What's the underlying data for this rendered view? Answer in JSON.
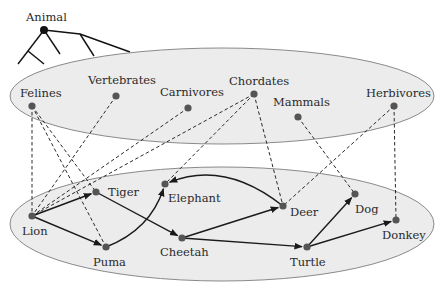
{
  "colors": {
    "ellipse_fill": "#ececec",
    "ellipse_stroke": "#8a8a8a",
    "node": "#555555",
    "root_node": "#111111",
    "edge": "#1a1a1a",
    "dashed": "#2a2a2a"
  },
  "tree": {
    "root_label": "Animal",
    "root": [
      44,
      30
    ]
  },
  "upper_layer": {
    "name": "categories",
    "ellipse": {
      "cx": 222,
      "cy": 96,
      "rx": 212,
      "ry": 48
    },
    "nodes": [
      {
        "id": "felines",
        "label": "Felines",
        "x": 32,
        "y": 106,
        "lx": 20,
        "ly": 97
      },
      {
        "id": "vertebrates",
        "label": "Vertebrates",
        "x": 116,
        "y": 96,
        "lx": 88,
        "ly": 84
      },
      {
        "id": "carnivores",
        "label": "Carnivores",
        "x": 188,
        "y": 108,
        "lx": 160,
        "ly": 96
      },
      {
        "id": "chordates",
        "label": "Chordates",
        "x": 254,
        "y": 94,
        "lx": 229,
        "ly": 85
      },
      {
        "id": "mammals",
        "label": "Mammals",
        "x": 298,
        "y": 117,
        "lx": 273,
        "ly": 106
      },
      {
        "id": "herbivores",
        "label": "Herbivores",
        "x": 394,
        "y": 106,
        "lx": 366,
        "ly": 97
      }
    ]
  },
  "lower_layer": {
    "name": "instances",
    "ellipse": {
      "cx": 222,
      "cy": 224,
      "rx": 212,
      "ry": 57
    },
    "nodes": [
      {
        "id": "lion",
        "label": "Lion",
        "x": 32,
        "y": 216,
        "lx": 22,
        "ly": 235
      },
      {
        "id": "tiger",
        "label": "Tiger",
        "x": 96,
        "y": 192,
        "lx": 108,
        "ly": 196
      },
      {
        "id": "puma",
        "label": "Puma",
        "x": 106,
        "y": 247,
        "lx": 93,
        "ly": 266
      },
      {
        "id": "elephant",
        "label": "Elephant",
        "x": 165,
        "y": 184,
        "lx": 168,
        "ly": 202
      },
      {
        "id": "cheetah",
        "label": "Cheetah",
        "x": 182,
        "y": 238,
        "lx": 160,
        "ly": 256
      },
      {
        "id": "deer",
        "label": "Deer",
        "x": 283,
        "y": 206,
        "lx": 290,
        "ly": 216
      },
      {
        "id": "dog",
        "label": "Dog",
        "x": 355,
        "y": 194,
        "lx": 355,
        "ly": 213
      },
      {
        "id": "turtle",
        "label": "Turtle",
        "x": 307,
        "y": 247,
        "lx": 290,
        "ly": 266
      },
      {
        "id": "donkey",
        "label": "Donkey",
        "x": 396,
        "y": 220,
        "lx": 382,
        "ly": 239
      }
    ]
  },
  "directed_edges": [
    {
      "from": "lion",
      "to": "tiger"
    },
    {
      "from": "lion",
      "to": "puma"
    },
    {
      "from": "puma",
      "to": "elephant",
      "curved": true
    },
    {
      "from": "tiger",
      "to": "cheetah"
    },
    {
      "from": "deer",
      "to": "elephant",
      "curved": true
    },
    {
      "from": "cheetah",
      "to": "deer"
    },
    {
      "from": "cheetah",
      "to": "turtle"
    },
    {
      "from": "turtle",
      "to": "dog"
    },
    {
      "from": "turtle",
      "to": "donkey"
    }
  ],
  "membership_edges": [
    {
      "from": "felines",
      "to": "lion"
    },
    {
      "from": "felines",
      "to": "tiger"
    },
    {
      "from": "felines",
      "to": "puma"
    },
    {
      "from": "vertebrates",
      "to": "lion"
    },
    {
      "from": "carnivores",
      "to": "lion"
    },
    {
      "from": "chordates",
      "to": "lion"
    },
    {
      "from": "chordates",
      "to": "elephant"
    },
    {
      "from": "chordates",
      "to": "deer"
    },
    {
      "from": "mammals",
      "to": "dog"
    },
    {
      "from": "herbivores",
      "to": "deer"
    },
    {
      "from": "herbivores",
      "to": "donkey"
    }
  ]
}
